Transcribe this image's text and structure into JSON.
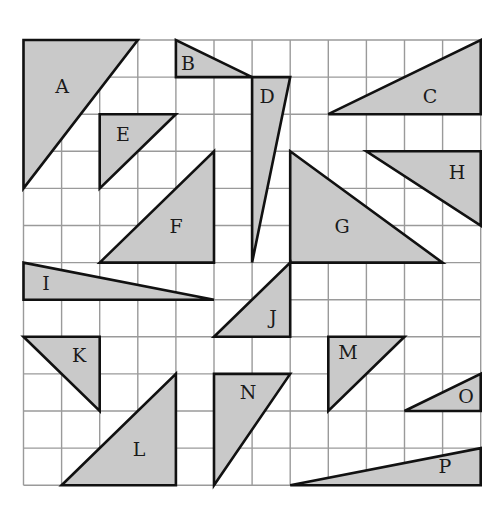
{
  "figure": {
    "grid": {
      "cols": 12,
      "rows": 12,
      "origin_px": [
        23.5,
        40
      ],
      "cell_w": 38.1,
      "cell_h": 37.1
    },
    "colors": {
      "fill": "#c9c9c9",
      "outline": "#111111",
      "grid": "#9a9a9a",
      "background": "#ffffff"
    },
    "triangles": [
      {
        "label": "A",
        "points": [
          [
            0,
            0
          ],
          [
            3,
            0
          ],
          [
            0,
            4
          ]
        ],
        "label_px": [
          62,
          88
        ]
      },
      {
        "label": "B",
        "points": [
          [
            4,
            0
          ],
          [
            4,
            1
          ],
          [
            6,
            1
          ]
        ],
        "label_px": [
          188,
          65
        ]
      },
      {
        "label": "C",
        "points": [
          [
            8,
            2
          ],
          [
            12,
            0
          ],
          [
            12,
            2
          ]
        ],
        "label_px": [
          430,
          98
        ]
      },
      {
        "label": "D",
        "points": [
          [
            6,
            1
          ],
          [
            7,
            1
          ],
          [
            6,
            6
          ]
        ],
        "label_px": [
          267,
          98
        ]
      },
      {
        "label": "E",
        "points": [
          [
            2,
            2
          ],
          [
            4,
            2
          ],
          [
            2,
            4
          ]
        ],
        "label_px": [
          123,
          136
        ]
      },
      {
        "label": "F",
        "points": [
          [
            5,
            3
          ],
          [
            5,
            6
          ],
          [
            2,
            6
          ]
        ],
        "label_px": [
          176,
          228
        ]
      },
      {
        "label": "G",
        "points": [
          [
            7,
            3
          ],
          [
            7,
            6
          ],
          [
            11,
            6
          ]
        ],
        "label_px": [
          342,
          228
        ]
      },
      {
        "label": "H",
        "points": [
          [
            9,
            3
          ],
          [
            12,
            3
          ],
          [
            12,
            5
          ]
        ],
        "label_px": [
          457,
          174
        ]
      },
      {
        "label": "I",
        "points": [
          [
            0,
            6
          ],
          [
            0,
            7
          ],
          [
            5,
            7
          ]
        ],
        "label_px": [
          46,
          285
        ]
      },
      {
        "label": "J",
        "points": [
          [
            7,
            6
          ],
          [
            7,
            8
          ],
          [
            5,
            8
          ]
        ],
        "label_px": [
          273,
          319
        ]
      },
      {
        "label": "K",
        "points": [
          [
            0,
            8
          ],
          [
            2,
            8
          ],
          [
            2,
            10
          ]
        ],
        "label_px": [
          79,
          357
        ]
      },
      {
        "label": "L",
        "points": [
          [
            4,
            9
          ],
          [
            4,
            12
          ],
          [
            1,
            12
          ]
        ],
        "label_px": [
          139,
          451
        ]
      },
      {
        "label": "M",
        "points": [
          [
            8,
            8
          ],
          [
            10,
            8
          ],
          [
            8,
            10
          ]
        ],
        "label_px": [
          348,
          354
        ]
      },
      {
        "label": "N",
        "points": [
          [
            5,
            9
          ],
          [
            7,
            9
          ],
          [
            5,
            12
          ]
        ],
        "label_px": [
          248,
          394
        ]
      },
      {
        "label": "O",
        "points": [
          [
            12,
            9
          ],
          [
            12,
            10
          ],
          [
            10,
            10
          ]
        ],
        "label_px": [
          466,
          398
        ]
      },
      {
        "label": "P",
        "points": [
          [
            7,
            12
          ],
          [
            12,
            11
          ],
          [
            12,
            12
          ]
        ],
        "label_px": [
          445,
          468
        ]
      }
    ]
  }
}
